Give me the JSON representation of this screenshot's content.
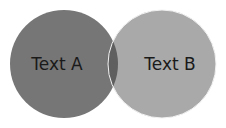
{
  "diagram": {
    "type": "venn",
    "sets": [
      {
        "label": "Text A",
        "color": "#767676"
      },
      {
        "label": "Text B",
        "color": "#a9a9a9"
      }
    ],
    "overlap_color": "#5f5f5f",
    "outline_color": "#f2f2f2"
  }
}
